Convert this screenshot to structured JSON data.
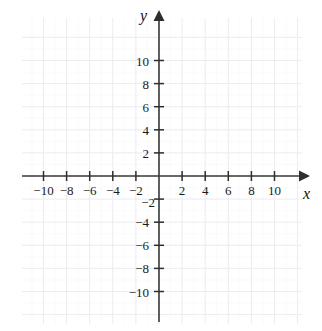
{
  "chart_data": {
    "type": "scatter",
    "title": "",
    "subtitle": "",
    "xlabel": "x",
    "ylabel": "y",
    "xlim": [
      -12,
      12
    ],
    "ylim": [
      -12,
      12
    ],
    "x_tick_labels": [
      "-10",
      "-8",
      "-6",
      "-4",
      "-2",
      "2",
      "4",
      "6",
      "8",
      "10"
    ],
    "x_tick_values": [
      -10,
      -8,
      -6,
      -4,
      -2,
      2,
      4,
      6,
      8,
      10
    ],
    "y_tick_labels": [
      "10",
      "8",
      "6",
      "4",
      "2",
      "-2",
      "-4",
      "-6",
      "-8",
      "-10"
    ],
    "y_tick_values": [
      10,
      8,
      6,
      4,
      2,
      -2,
      -4,
      -6,
      -8,
      -10
    ],
    "tick_step": 2,
    "grid": true,
    "grid_step": 2,
    "legend": "none",
    "series": [],
    "values": [],
    "x": [],
    "annotations": [],
    "origin_label": ""
  },
  "axes": {
    "x_name": "x",
    "y_name": "y"
  },
  "colors": {
    "axis": "#3a3a3a",
    "grid_major": "#ededf2",
    "grid_minor": "#f5f5f8",
    "tick_text": "#1a1a1a",
    "background": "#ffffff"
  }
}
